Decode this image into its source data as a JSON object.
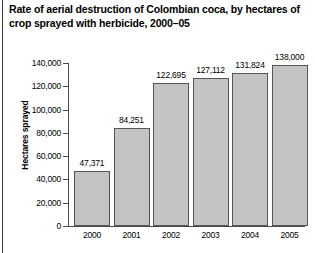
{
  "chart_data": {
    "type": "bar",
    "title": "Rate of aerial destruction of Colombian coca, by hectares of crop sprayed with herbicide, 2000–05",
    "xlabel": "",
    "ylabel": "Hectares sprayed",
    "ylim": [
      0,
      140000
    ],
    "ytick_step": 20000,
    "grid": false,
    "legend": null,
    "categories": [
      "2000",
      "2001",
      "2002",
      "2003",
      "2004",
      "2005"
    ],
    "values": [
      47371,
      84251,
      122695,
      127112,
      131824,
      138000
    ],
    "value_labels": [
      "47,371",
      "84,251",
      "122,695",
      "127,112",
      "131,824",
      "138,000"
    ],
    "ytick_labels": [
      "0",
      "20,000",
      "40,000",
      "60,000",
      "80,000",
      "100,000",
      "120,000",
      "140,000"
    ],
    "ytick_values": [
      0,
      20000,
      40000,
      60000,
      80000,
      100000,
      120000,
      140000
    ],
    "series": [
      {
        "name": "Hectares sprayed",
        "values": [
          47371,
          84251,
          122695,
          127112,
          131824,
          138000
        ]
      }
    ]
  },
  "colors": {
    "bar_fill": "#c4c4c4",
    "bar_border": "#555555",
    "axis": "#4a4a4a",
    "text": "#000000",
    "background": "#ffffff"
  }
}
